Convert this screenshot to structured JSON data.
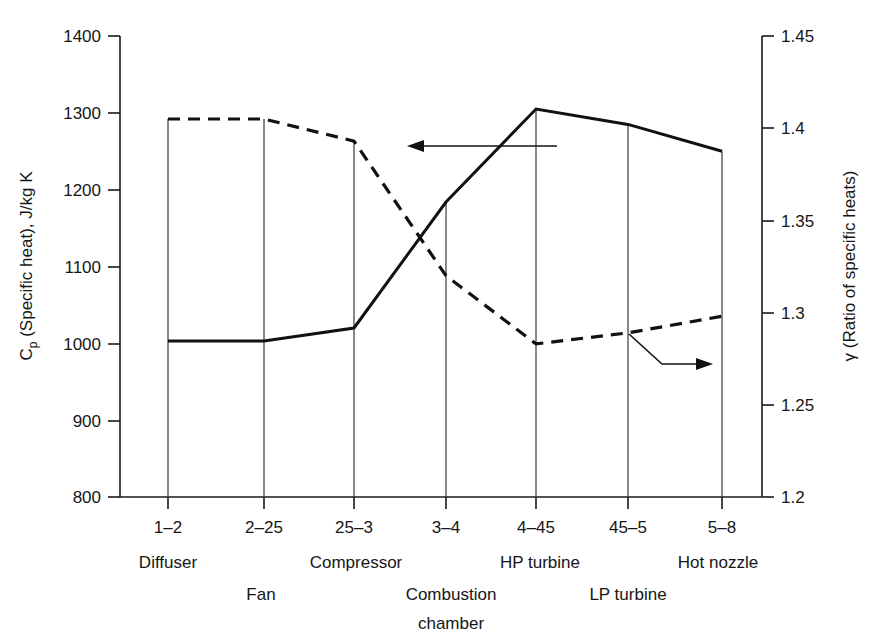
{
  "chart_data": {
    "type": "line",
    "title": "",
    "subtitle": "",
    "categories": [
      "1–2",
      "2–25",
      "25–3",
      "3–4",
      "4–45",
      "45–5",
      "5–8"
    ],
    "component_labels_row1": [
      "Diffuser",
      "Compressor",
      "HP turbine",
      "Hot nozzle"
    ],
    "component_labels_row2": [
      "Fan",
      "Combustion",
      "LP turbine"
    ],
    "component_labels_row3": [
      "chamber"
    ],
    "components": [
      {
        "name": "Diffuser",
        "station": "1–2"
      },
      {
        "name": "Fan",
        "station": "2–25"
      },
      {
        "name": "Compressor",
        "station": "25–3"
      },
      {
        "name": "Combustion chamber",
        "station": "3–4"
      },
      {
        "name": "HP turbine",
        "station": "4–45"
      },
      {
        "name": "LP turbine",
        "station": "45–5"
      },
      {
        "name": "Hot nozzle",
        "station": "5–8"
      }
    ],
    "xlabel": "",
    "left_axis": {
      "label": "Cp (Specific heat), J/kg K",
      "label_symbol": "C",
      "label_subscript": "p",
      "label_rest": " (Specific heat), J/kg K",
      "ticks": [
        "800",
        "900",
        "1000",
        "1100",
        "1200",
        "1300",
        "1400"
      ],
      "tick_values": [
        800,
        900,
        1000,
        1100,
        1200,
        1300,
        1400
      ],
      "ylim": [
        800,
        1400
      ]
    },
    "right_axis": {
      "label": "γ (Ratio of specific heats)",
      "label_symbol": "γ",
      "label_rest": " (Ratio of specific heats)",
      "ticks": [
        "1.2",
        "1.25",
        "1.3",
        "1.35",
        "1.4",
        "1.45"
      ],
      "tick_values": [
        1.2,
        1.25,
        1.3,
        1.35,
        1.4,
        1.45
      ],
      "ylim": [
        1.2,
        1.45
      ]
    },
    "series": [
      {
        "name": "Cp (Specific heat)",
        "axis": "left",
        "style": "solid",
        "x_stations": [
          "1–2 start",
          "2–25",
          "25–3",
          "3–4",
          "4–45",
          "45–5",
          "5–8 end"
        ],
        "values": [
          1003,
          1003,
          1020,
          1184,
          1305,
          1285,
          1250
        ]
      },
      {
        "name": "γ (Ratio of specific heats)",
        "axis": "right",
        "style": "dashed",
        "x_stations": [
          "1–2 start",
          "2–25",
          "25–3",
          "3–4",
          "4–45",
          "45–5",
          "5–8 end"
        ],
        "values": [
          1.405,
          1.405,
          1.393,
          1.32,
          1.283,
          1.289,
          1.298
        ]
      }
    ],
    "annotations": [
      {
        "name": "left-arrow-to-cp",
        "direction": "left",
        "points_to": "Cp (Specific heat)"
      },
      {
        "name": "right-arrow-to-gamma",
        "direction": "right",
        "points_to": "γ (Ratio of specific heats)"
      }
    ],
    "grid": false,
    "legend": "none (arrows label curves)",
    "colors": {
      "line": "#111111",
      "axis": "#1a1a1a",
      "background": "#ffffff"
    }
  }
}
